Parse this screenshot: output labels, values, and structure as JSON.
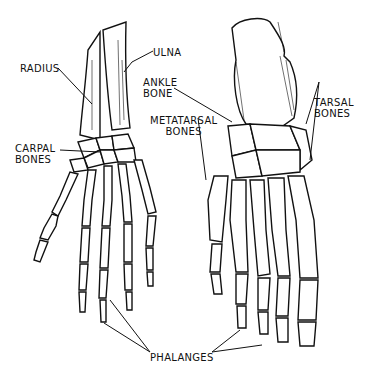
{
  "figure": {
    "panels": [
      "hand-and-wrist",
      "foot"
    ]
  },
  "labels": {
    "radius": "Radius",
    "ulna": "Ulna",
    "carpal_line1": "Carpal",
    "carpal_line2": "Bones",
    "ankle_line1": "Ankle",
    "ankle_line2": "Bone",
    "metatarsal_line1": "Metatarsal",
    "metatarsal_line2": "Bones",
    "tarsal_line1": "Tarsal",
    "tarsal_line2": "Bones",
    "phalanges": "Phalanges"
  },
  "colors": {
    "ink": "#111111",
    "background": "#ffffff"
  }
}
